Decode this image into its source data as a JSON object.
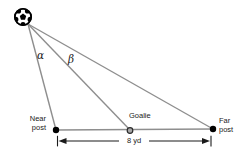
{
  "diagram": {
    "labels": {
      "near_post": "Near\npost",
      "goalie": "Goalie",
      "far_post": "Far\npost",
      "distance": "8 yd",
      "angle_alpha": "α",
      "angle_beta": "β"
    },
    "icons": {
      "ball": "soccer-ball-icon"
    },
    "colors": {
      "background": "#ffffff",
      "line": "#8e8e8e",
      "ink": "#1a1a1a",
      "goalie_fill": "#a8a8a8"
    }
  }
}
